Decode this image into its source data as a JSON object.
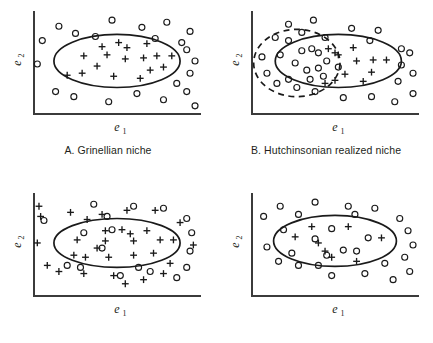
{
  "figure": {
    "background_color": "#ffffff",
    "ink_color": "#1a1a1a",
    "axis_color": "#3b3b3b"
  },
  "axis_labels": {
    "x_base": "e",
    "x_sub": "1",
    "y_base": "e",
    "y_sub": "2"
  },
  "captions": {
    "a": "A. Grinellian niche",
    "b": "B. Hutchinsonian realized niche",
    "c": "",
    "d": ""
  },
  "legend_semantics": {
    "plus": "species presence",
    "circle": "species absence",
    "solid_ellipse": "fundamental / realized niche boundary",
    "dashed_circle": "competitor or excluding factor envelope"
  },
  "chart_data": {
    "type": "scatter",
    "xlabel": "e1",
    "ylabel": "e2",
    "grid": false,
    "legend_position": "none",
    "xlim": [
      0,
      100
    ],
    "ylim": [
      0,
      100
    ],
    "panels": [
      {
        "id": "A",
        "caption": "A. Grinellian niche",
        "shapes": [
          {
            "kind": "ellipse",
            "style": "solid",
            "cx": 50,
            "cy": 52,
            "rx": 38,
            "ry": 26
          }
        ],
        "plus_points": [
          [
            41,
            66
          ],
          [
            51,
            70
          ],
          [
            56,
            65
          ],
          [
            68,
            69
          ],
          [
            30,
            57
          ],
          [
            44,
            58
          ],
          [
            55,
            54
          ],
          [
            66,
            55
          ],
          [
            74,
            57
          ],
          [
            83,
            57
          ],
          [
            38,
            47
          ],
          [
            20,
            38
          ],
          [
            29,
            40
          ],
          [
            48,
            37
          ],
          [
            70,
            43
          ],
          [
            64,
            35
          ],
          [
            78,
            46
          ]
        ],
        "circle_points": [
          [
            15,
            86
          ],
          [
            25,
            79
          ],
          [
            47,
            92
          ],
          [
            65,
            85
          ],
          [
            80,
            90
          ],
          [
            94,
            81
          ],
          [
            5,
            72
          ],
          [
            37,
            76
          ],
          [
            73,
            74
          ],
          [
            92,
            63
          ],
          [
            89,
            70
          ],
          [
            2,
            49
          ],
          [
            97,
            52
          ],
          [
            94,
            40
          ],
          [
            13,
            22
          ],
          [
            24,
            17
          ],
          [
            45,
            12
          ],
          [
            62,
            20
          ],
          [
            78,
            14
          ],
          [
            92,
            22
          ],
          [
            97,
            8
          ],
          [
            86,
            30
          ]
        ]
      },
      {
        "id": "B",
        "caption": "B. Hutchinsonian realized niche",
        "shapes": [
          {
            "kind": "ellipse",
            "style": "solid",
            "cx": 52,
            "cy": 52,
            "rx": 38,
            "ry": 26
          },
          {
            "kind": "circle",
            "style": "dashed",
            "cx": 27,
            "cy": 50,
            "rx": 26,
            "ry": 33
          }
        ],
        "plus_points": [
          [
            46,
            64
          ],
          [
            50,
            60
          ],
          [
            61,
            65
          ],
          [
            52,
            58
          ],
          [
            63,
            52
          ],
          [
            73,
            53
          ],
          [
            81,
            53
          ],
          [
            72,
            41
          ],
          [
            56,
            39
          ],
          [
            50,
            33
          ],
          [
            67,
            32
          ],
          [
            44,
            30
          ]
        ],
        "circle_points": [
          [
            22,
            88
          ],
          [
            37,
            92
          ],
          [
            30,
            80
          ],
          [
            14,
            75
          ],
          [
            22,
            72
          ],
          [
            44,
            75
          ],
          [
            60,
            84
          ],
          [
            76,
            82
          ],
          [
            71,
            72
          ],
          [
            90,
            64
          ],
          [
            6,
            56
          ],
          [
            17,
            58
          ],
          [
            30,
            62
          ],
          [
            36,
            64
          ],
          [
            40,
            60
          ],
          [
            26,
            50
          ],
          [
            45,
            52
          ],
          [
            40,
            45
          ],
          [
            33,
            43
          ],
          [
            52,
            46
          ],
          [
            95,
            60
          ],
          [
            90,
            48
          ],
          [
            22,
            34
          ],
          [
            35,
            34
          ],
          [
            43,
            37
          ],
          [
            15,
            30
          ],
          [
            27,
            26
          ],
          [
            38,
            22
          ],
          [
            55,
            16
          ],
          [
            72,
            17
          ],
          [
            88,
            32
          ],
          [
            86,
            12
          ],
          [
            97,
            20
          ],
          [
            97,
            40
          ],
          [
            9,
            40
          ]
        ]
      },
      {
        "id": "C",
        "caption": "",
        "shapes": [
          {
            "kind": "ellipse",
            "style": "solid",
            "cx": 50,
            "cy": 52,
            "rx": 38,
            "ry": 24
          }
        ],
        "plus_points": [
          [
            22,
            82
          ],
          [
            41,
            80
          ],
          [
            56,
            84
          ],
          [
            73,
            84
          ],
          [
            32,
            75
          ],
          [
            88,
            72
          ],
          [
            3,
            88
          ],
          [
            4,
            78
          ],
          [
            43,
            64
          ],
          [
            53,
            65
          ],
          [
            58,
            61
          ],
          [
            68,
            64
          ],
          [
            26,
            55
          ],
          [
            43,
            54
          ],
          [
            60,
            54
          ],
          [
            76,
            55
          ],
          [
            84,
            55
          ],
          [
            38,
            47
          ],
          [
            2,
            52
          ],
          [
            96,
            50
          ],
          [
            24,
            40
          ],
          [
            31,
            38
          ],
          [
            45,
            38
          ],
          [
            60,
            40
          ],
          [
            72,
            42
          ],
          [
            82,
            32
          ],
          [
            15,
            24
          ],
          [
            30,
            22
          ],
          [
            48,
            20
          ],
          [
            66,
            16
          ],
          [
            78,
            22
          ],
          [
            55,
            12
          ],
          [
            8,
            30
          ]
        ],
        "circle_points": [
          [
            36,
            90
          ],
          [
            60,
            88
          ],
          [
            78,
            86
          ],
          [
            6,
            74
          ],
          [
            44,
            78
          ],
          [
            92,
            76
          ],
          [
            47,
            65
          ],
          [
            41,
            47
          ],
          [
            95,
            62
          ],
          [
            94,
            44
          ],
          [
            20,
            30
          ],
          [
            28,
            28
          ],
          [
            52,
            20
          ],
          [
            70,
            24
          ],
          [
            86,
            18
          ],
          [
            92,
            28
          ],
          [
            63,
            28
          ],
          [
            30,
            62
          ]
        ]
      },
      {
        "id": "D",
        "caption": "",
        "shapes": [
          {
            "kind": "ellipse",
            "style": "solid",
            "cx": 50,
            "cy": 54,
            "rx": 37,
            "ry": 25
          }
        ],
        "plus_points": [
          [
            36,
            68
          ],
          [
            58,
            68
          ],
          [
            26,
            58
          ],
          [
            40,
            52
          ],
          [
            78,
            57
          ],
          [
            48,
            38
          ],
          [
            63,
            34
          ],
          [
            44,
            44
          ]
        ],
        "circle_points": [
          [
            17,
            88
          ],
          [
            38,
            92
          ],
          [
            58,
            88
          ],
          [
            74,
            86
          ],
          [
            7,
            78
          ],
          [
            28,
            80
          ],
          [
            62,
            80
          ],
          [
            89,
            76
          ],
          [
            48,
            66
          ],
          [
            70,
            57
          ],
          [
            38,
            56
          ],
          [
            55,
            45
          ],
          [
            63,
            44
          ],
          [
            45,
            40
          ],
          [
            19,
            65
          ],
          [
            94,
            64
          ],
          [
            24,
            42
          ],
          [
            40,
            30
          ],
          [
            97,
            50
          ],
          [
            92,
            38
          ],
          [
            16,
            34
          ],
          [
            28,
            30
          ],
          [
            48,
            20
          ],
          [
            68,
            22
          ],
          [
            85,
            16
          ],
          [
            95,
            24
          ],
          [
            80,
            32
          ],
          [
            9,
            48
          ]
        ]
      }
    ]
  },
  "panel_layout": [
    {
      "id": "A",
      "left": 8,
      "top": 4,
      "width": 200,
      "height": 132
    },
    {
      "id": "B",
      "left": 226,
      "top": 4,
      "width": 200,
      "height": 132
    },
    {
      "id": "C",
      "left": 8,
      "top": 186,
      "width": 200,
      "height": 132
    },
    {
      "id": "D",
      "left": 226,
      "top": 186,
      "width": 200,
      "height": 132
    }
  ]
}
